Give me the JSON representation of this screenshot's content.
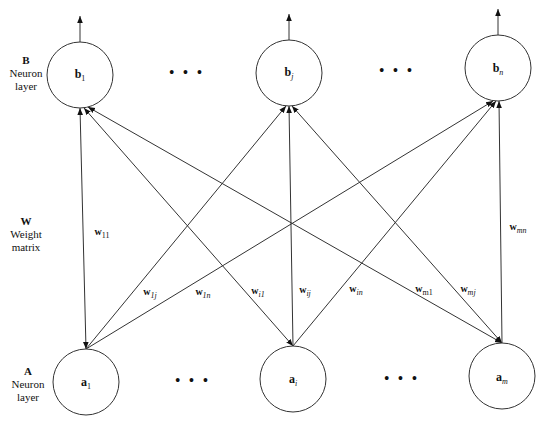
{
  "layers": {
    "B": {
      "letter": "B",
      "line1": "Neuron",
      "line2": "layer"
    },
    "W": {
      "letter": "W",
      "line1": "Weight",
      "line2": "matrix"
    },
    "A": {
      "letter": "A",
      "line1": "Neuron",
      "line2": "layer"
    }
  },
  "nodes": {
    "b1": {
      "base": "b",
      "sub": "1",
      "cx": 80,
      "cy": 75
    },
    "bj": {
      "base": "b",
      "sub": "j",
      "cx": 289,
      "cy": 73
    },
    "bn": {
      "base": "b",
      "sub": "n",
      "cx": 498,
      "cy": 68
    },
    "a1": {
      "base": "a",
      "sub": "1",
      "cx": 86,
      "cy": 382
    },
    "ai": {
      "base": "a",
      "sub": "i",
      "cx": 293,
      "cy": 379
    },
    "am": {
      "base": "a",
      "sub": "m",
      "cx": 502,
      "cy": 376
    }
  },
  "node_radius": 33,
  "ellipsis": "•••",
  "weights": {
    "w11": {
      "base": "w",
      "sub": "11"
    },
    "w1j": {
      "base": "w",
      "sub": "1j"
    },
    "w1n": {
      "base": "w",
      "sub": "1n"
    },
    "wi1": {
      "base": "w",
      "sub": "i1"
    },
    "wij": {
      "base": "w",
      "sub": "ij"
    },
    "win": {
      "base": "w",
      "sub": "in"
    },
    "wm1": {
      "base": "w",
      "sub": "m1"
    },
    "wmj": {
      "base": "w",
      "sub": "mj"
    },
    "wmn": {
      "base": "w",
      "sub": "mn"
    }
  },
  "colors": {
    "stroke": "#333333",
    "background": "#ffffff"
  }
}
